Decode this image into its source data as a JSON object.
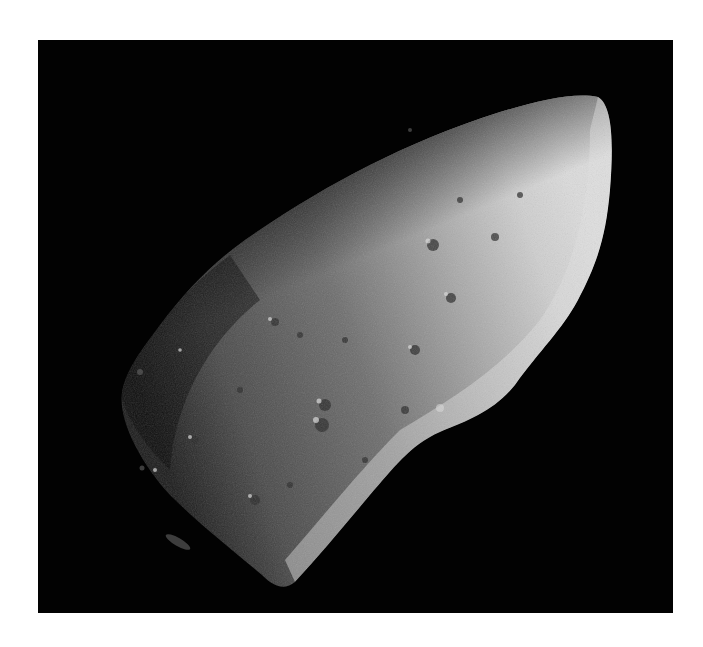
{
  "image": {
    "subject": "Cratered irregular asteroid photographed against black space",
    "background_color": "#020202",
    "border_color": "#ffffff",
    "palette": {
      "shadow": "#1a1a1a",
      "mid": "#6a6a6a",
      "lit": "#c8c8c8",
      "highlight": "#e6e6e6"
    }
  }
}
